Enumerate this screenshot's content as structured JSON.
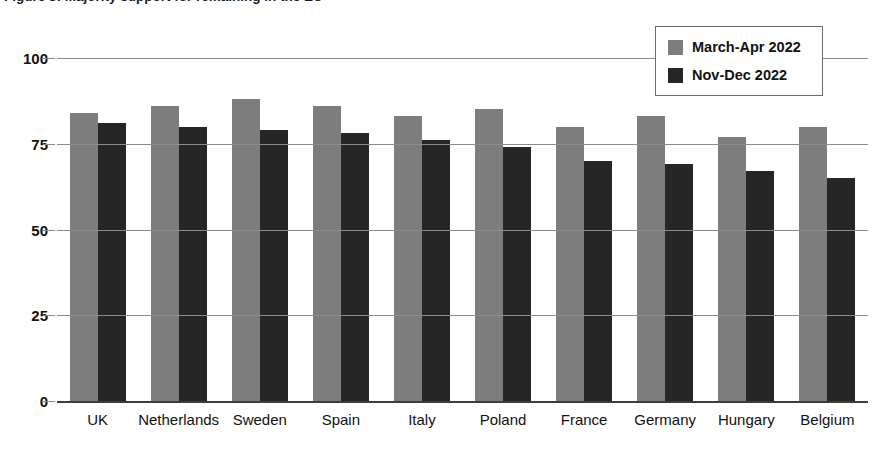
{
  "caption": {
    "text": "Figure 3: Majority support for remaining in the EU"
  },
  "chart_data": {
    "type": "bar",
    "title": "",
    "subtitle": "",
    "xlabel": "",
    "ylabel": "",
    "ylim": [
      0,
      100
    ],
    "yticks": [
      0,
      25,
      50,
      75,
      100
    ],
    "grid": true,
    "legend_position": "top-right",
    "categories": [
      "UK",
      "Netherlands",
      "Sweden",
      "Spain",
      "Italy",
      "Poland",
      "France",
      "Germany",
      "Hungary",
      "Belgium"
    ],
    "series": [
      {
        "name": "March-Apr 2022",
        "color": "#7d7d7d",
        "values": [
          84,
          86,
          88,
          86,
          83,
          85,
          80,
          83,
          77,
          80
        ]
      },
      {
        "name": "Nov-Dec 2022",
        "color": "#262626",
        "values": [
          81,
          80,
          79,
          78,
          76,
          74,
          70,
          69,
          67,
          65
        ]
      }
    ]
  }
}
